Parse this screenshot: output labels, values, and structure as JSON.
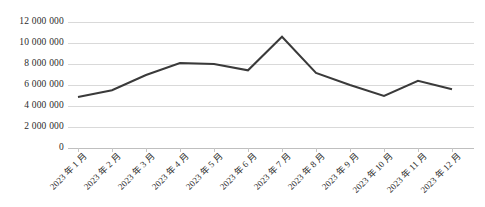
{
  "chart_data": {
    "type": "line",
    "title": "",
    "xlabel": "",
    "ylabel": "",
    "categories": [
      "2023 年 1 月",
      "2023 年 2 月",
      "2023 年 3 月",
      "2023 年 4 月",
      "2023 年 5 月",
      "2023 年 6 月",
      "2023 年 7 月",
      "2023 年 8 月",
      "2023 年 9 月",
      "2023 年 10 月",
      "2023 年 11 月",
      "2023 年 12 月"
    ],
    "values": [
      4860000,
      5500000,
      6950000,
      8100000,
      8000000,
      7400000,
      10600000,
      7150000,
      6000000,
      4950000,
      6400000,
      5600000
    ],
    "ylim": [
      0,
      12000000
    ],
    "ytick_values": [
      0,
      2000000,
      4000000,
      6000000,
      8000000,
      10000000,
      12000000
    ],
    "ytick_labels": [
      "0",
      "2 000 000",
      "4 000 000",
      "6 000 000",
      "8 000 000",
      "10 000 000",
      "12 000 000"
    ],
    "grid": true,
    "legend": "none",
    "series_color": "#3a3a3a",
    "gridline_color": "#d9d9d9",
    "line_width": 2
  }
}
